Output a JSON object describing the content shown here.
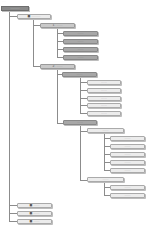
{
  "caption": "……",
  "nodes": {
    "root": "………",
    "n1": "■ ………",
    "n1_1": "1. ……",
    "n1_1_children": [
      "……",
      "……",
      "……",
      "……"
    ],
    "n1_2": "2. ……",
    "n1_2_1": "……",
    "n1_2_1_children": [
      "……",
      "……",
      "……",
      "……",
      "……"
    ],
    "n1_2_2": "……",
    "n1_2_2_1": "……",
    "n1_2_2_1_children": [
      "……",
      "……",
      "……",
      "……",
      "……"
    ],
    "n1_2_2_2": "……",
    "n1_2_2_2_children": [
      "……",
      "……"
    ],
    "bottom": [
      "■ ……",
      "■ ……",
      "■ ……"
    ]
  },
  "colors": {
    "root_fill": "#8a8a8a",
    "node_fill": "#d4d4d4",
    "connector": "#8c8c8c"
  }
}
